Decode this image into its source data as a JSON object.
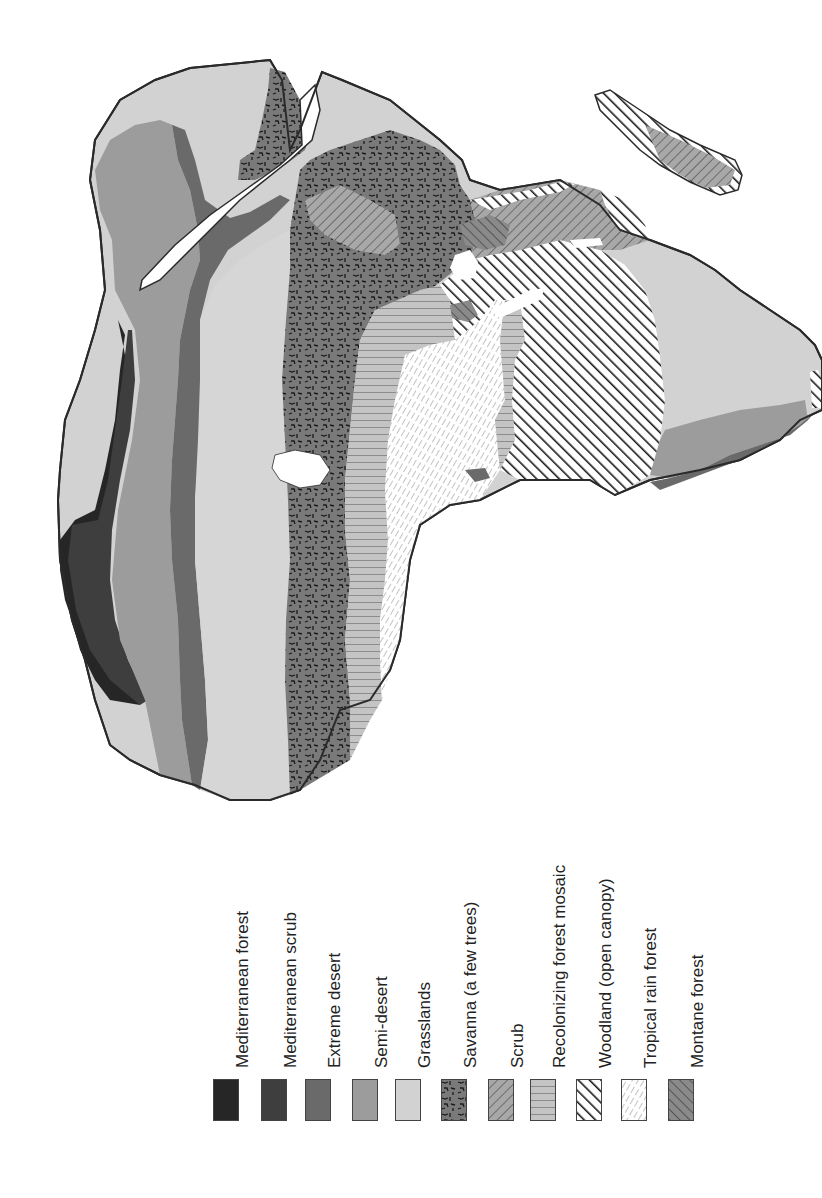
{
  "map": {
    "title": "",
    "colors": {
      "mediterranean_forest": "#262626",
      "mediterranean_scrub": "#3e3e3e",
      "extreme_desert": "#6a6a6a",
      "semi_desert": "#9c9c9c",
      "grasslands": "#d2d2d2",
      "savanna": "#7a7a7a",
      "scrub": "#a8a8a8",
      "recolonizing": "#c4c4c4",
      "woodland": "#ffffff",
      "tropical": "#ffffff",
      "montane": "#8a8a8a",
      "outline": "#2a2a2a"
    }
  },
  "legend": {
    "items": [
      {
        "label": "Mediterranean forest",
        "pattern": "solid-black",
        "color": "#262626"
      },
      {
        "label": "Mediterranean scrub",
        "pattern": "solid-dark-gray",
        "color": "#3e3e3e"
      },
      {
        "label": "Extreme desert",
        "pattern": "solid-mid-dark-gray",
        "color": "#6a6a6a"
      },
      {
        "label": "Semi-desert",
        "pattern": "solid-mid-gray",
        "color": "#9c9c9c"
      },
      {
        "label": "Grasslands",
        "pattern": "solid-light-gray",
        "color": "#d2d2d2"
      },
      {
        "label": "Savanna (a few trees)",
        "pattern": "squiggle-dashes",
        "color": "#7a7a7a"
      },
      {
        "label": "Scrub",
        "pattern": "diagonal-hatch-up",
        "color": "#a8a8a8"
      },
      {
        "label": "Recolonizing forest mosaic",
        "pattern": "horizontal-lines",
        "color": "#c4c4c4"
      },
      {
        "label": "Woodland (open canopy)",
        "pattern": "bold-diagonal-stripes",
        "color": "#ffffff"
      },
      {
        "label": "Tropical rain forest",
        "pattern": "fine-dashed-diagonal",
        "color": "#ffffff"
      },
      {
        "label": "Montane forest",
        "pattern": "diagonal-hatch-down",
        "color": "#8a8a8a"
      }
    ]
  }
}
